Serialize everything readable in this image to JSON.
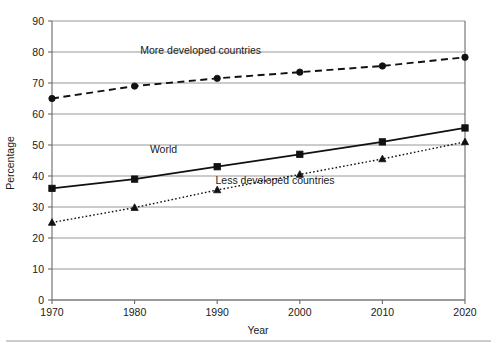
{
  "chart_data": {
    "type": "line",
    "title": "",
    "xlabel": "Year",
    "ylabel": "Percentage",
    "x": [
      1970,
      1980,
      1990,
      2000,
      2010,
      2020
    ],
    "xticklabels": [
      "1970",
      "1980",
      "1990",
      "2000",
      "2010",
      "2020"
    ],
    "yticks": [
      0,
      10,
      20,
      30,
      40,
      50,
      60,
      70,
      80,
      90
    ],
    "yticklabels": [
      "0",
      "10",
      "20",
      "30",
      "40",
      "50",
      "60",
      "70",
      "80",
      "90"
    ],
    "xlim": [
      1970,
      2020
    ],
    "ylim": [
      0,
      90
    ],
    "grid": "horizontal",
    "legend": "inline-labels",
    "series": [
      {
        "name": "More developed countries",
        "values": [
          65,
          69,
          71.5,
          73.5,
          75.5,
          78.3
        ],
        "marker": "circle",
        "linestyle": "dashed",
        "color": "#111111",
        "label_x": 1988,
        "label_y": 79.5
      },
      {
        "name": "World",
        "values": [
          36,
          39,
          43,
          47,
          51,
          55.5
        ],
        "marker": "square",
        "linestyle": "solid",
        "color": "#111111",
        "label_x": 1983.5,
        "label_y": 47.5
      },
      {
        "name": "Less developed countries",
        "values": [
          25,
          29.8,
          35.5,
          40.5,
          45.5,
          51
        ],
        "marker": "triangle",
        "linestyle": "dotted",
        "color": "#111111",
        "label_x": 1997,
        "label_y": 37.5
      }
    ]
  },
  "axis": {
    "x_title": "Year",
    "y_title": "Percentage"
  }
}
